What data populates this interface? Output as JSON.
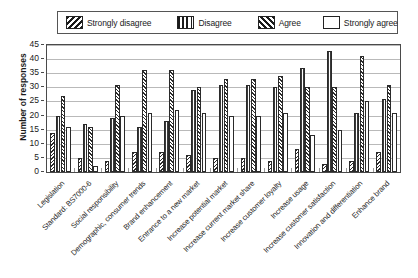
{
  "chart_data": {
    "type": "bar",
    "title": "",
    "subtitle": "",
    "xlabel": "",
    "ylabel": "Number of responses",
    "ylim": [
      0,
      45
    ],
    "ytick_step": 5,
    "yticks": [
      0,
      5,
      10,
      15,
      20,
      25,
      30,
      35,
      40,
      45
    ],
    "grid": true,
    "orientation": "vertical",
    "grouping": "clustered",
    "legend_position": "top",
    "xtick_rotation": -45,
    "categories": [
      "Legislation",
      "Standard: BS7000-6",
      "Social responsibility",
      "Demographic, consumer trends",
      "Brand enhancement",
      "Entrance to a new market",
      "Increase potential market",
      "Increase current market share",
      "Increase customer loyalty",
      "Increase usage",
      "Increase customer satisfaction",
      "Innovation and differentiation",
      "Enhance brand"
    ],
    "series": [
      {
        "name": "Strongly disagree",
        "pattern": "backward-diagonal-hatch",
        "values": [
          14,
          5,
          4,
          7,
          7,
          6,
          5,
          5,
          4,
          8,
          3,
          4,
          7
        ]
      },
      {
        "name": "Disagree",
        "pattern": "vertical-lines",
        "values": [
          20,
          17,
          19,
          16,
          18,
          29,
          31,
          31,
          30,
          37,
          43,
          21,
          26
        ]
      },
      {
        "name": "Agree",
        "pattern": "forward-diagonal-hatch",
        "values": [
          27,
          16,
          31,
          36,
          36,
          30,
          33,
          33,
          34,
          30,
          30,
          41,
          31
        ]
      },
      {
        "name": "Strongly agree",
        "pattern": "solid-white",
        "values": [
          16,
          2,
          20,
          21,
          22,
          21,
          20,
          20,
          21,
          13,
          15,
          25,
          21
        ]
      }
    ]
  },
  "legend": {
    "items": [
      {
        "label": "Strongly disagree",
        "swatch": "backward-diagonal-hatch-swatch"
      },
      {
        "label": "Disagree",
        "swatch": "vertical-lines-swatch"
      },
      {
        "label": "Agree",
        "swatch": "forward-diagonal-hatch-swatch"
      },
      {
        "label": "Strongly agree",
        "swatch": "white-swatch"
      }
    ]
  },
  "axis": {
    "y_title": "Number of responses"
  }
}
